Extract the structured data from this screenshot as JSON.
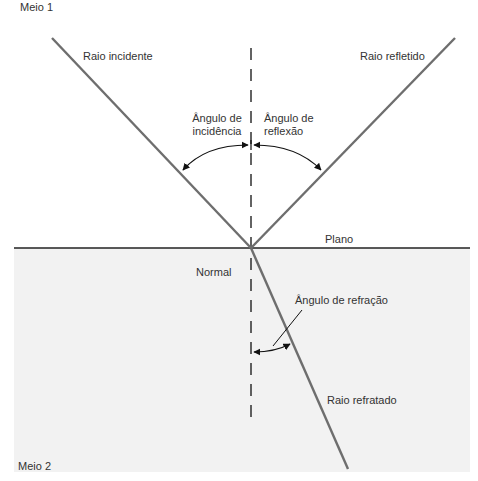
{
  "diagram": {
    "labels": {
      "medium1": "Meio 1",
      "medium2": "Meio 2",
      "incident_ray": "Raio incidente",
      "reflected_ray": "Raio refletido",
      "incidence_angle_line1": "Ângulo de",
      "incidence_angle_line2": "incidência",
      "reflection_angle_line1": "Ângulo de",
      "reflection_angle_line2": "reflexão",
      "plane": "Plano",
      "normal": "Normal",
      "refraction_angle": "Ângulo de refração",
      "refracted_ray": "Raio refratado"
    },
    "colors": {
      "ray": "#6e6e6e",
      "medium2_bg": "#f2f2f2",
      "plane": "#222222",
      "normal": "#222222"
    }
  }
}
